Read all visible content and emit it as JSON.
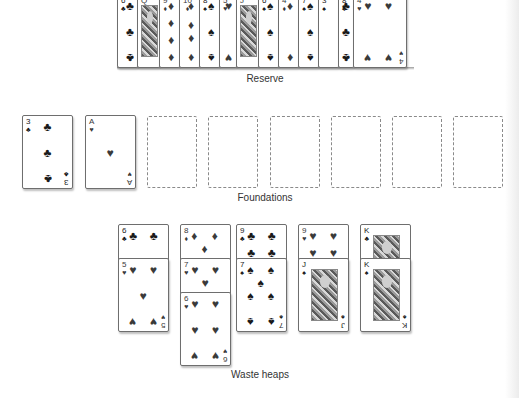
{
  "labels": {
    "reserve": "Reserve",
    "foundations": "Foundations",
    "waste_heaps": "Waste heaps"
  },
  "colors": {
    "background": "#ffffff",
    "card_border": "#6e6e6e",
    "slot_border": "#8a8a8a",
    "label_text": "#333333"
  },
  "reserve": {
    "cards": [
      {
        "rank": "6",
        "suit": "♣",
        "color": "black"
      },
      {
        "rank": "Q",
        "suit": "♦",
        "color": "red"
      },
      {
        "rank": "9",
        "suit": "♦",
        "color": "red"
      },
      {
        "rank": "10",
        "suit": "♦",
        "color": "red"
      },
      {
        "rank": "8",
        "suit": "♠",
        "color": "black"
      },
      {
        "rank": "5",
        "suit": "♥",
        "color": "red"
      },
      {
        "rank": "J",
        "suit": "♥",
        "color": "red"
      },
      {
        "rank": "6",
        "suit": "♠",
        "color": "black"
      },
      {
        "rank": "4",
        "suit": "♦",
        "color": "red"
      },
      {
        "rank": "7",
        "suit": "♠",
        "color": "black"
      },
      {
        "rank": "3",
        "suit": "♠",
        "color": "black"
      },
      {
        "rank": "8",
        "suit": "♣",
        "color": "black"
      },
      {
        "rank": "4",
        "suit": "♥",
        "color": "red"
      }
    ]
  },
  "foundations": {
    "slots": [
      {
        "card": {
          "rank": "3",
          "suit": "♣",
          "color": "black"
        }
      },
      {
        "card": {
          "rank": "A",
          "suit": "♥",
          "color": "red"
        }
      },
      {
        "card": null
      },
      {
        "card": null
      },
      {
        "card": null
      },
      {
        "card": null
      },
      {
        "card": null
      },
      {
        "card": null
      }
    ]
  },
  "waste_heaps": [
    {
      "cards": [
        {
          "rank": "6",
          "suit": "♣",
          "color": "black"
        },
        {
          "rank": "5",
          "suit": "♥",
          "color": "red"
        }
      ]
    },
    {
      "cards": [
        {
          "rank": "8",
          "suit": "♦",
          "color": "red"
        },
        {
          "rank": "7",
          "suit": "♥",
          "color": "red"
        },
        {
          "rank": "6",
          "suit": "♥",
          "color": "red"
        }
      ]
    },
    {
      "cards": [
        {
          "rank": "9",
          "suit": "♣",
          "color": "black"
        },
        {
          "rank": "7",
          "suit": "♠",
          "color": "black"
        }
      ]
    },
    {
      "cards": [
        {
          "rank": "9",
          "suit": "♥",
          "color": "red"
        },
        {
          "rank": "J",
          "suit": "♠",
          "color": "black"
        }
      ]
    },
    {
      "cards": [
        {
          "rank": "K",
          "suit": "♣",
          "color": "black"
        },
        {
          "rank": "K",
          "suit": "♠",
          "color": "black"
        }
      ]
    }
  ]
}
